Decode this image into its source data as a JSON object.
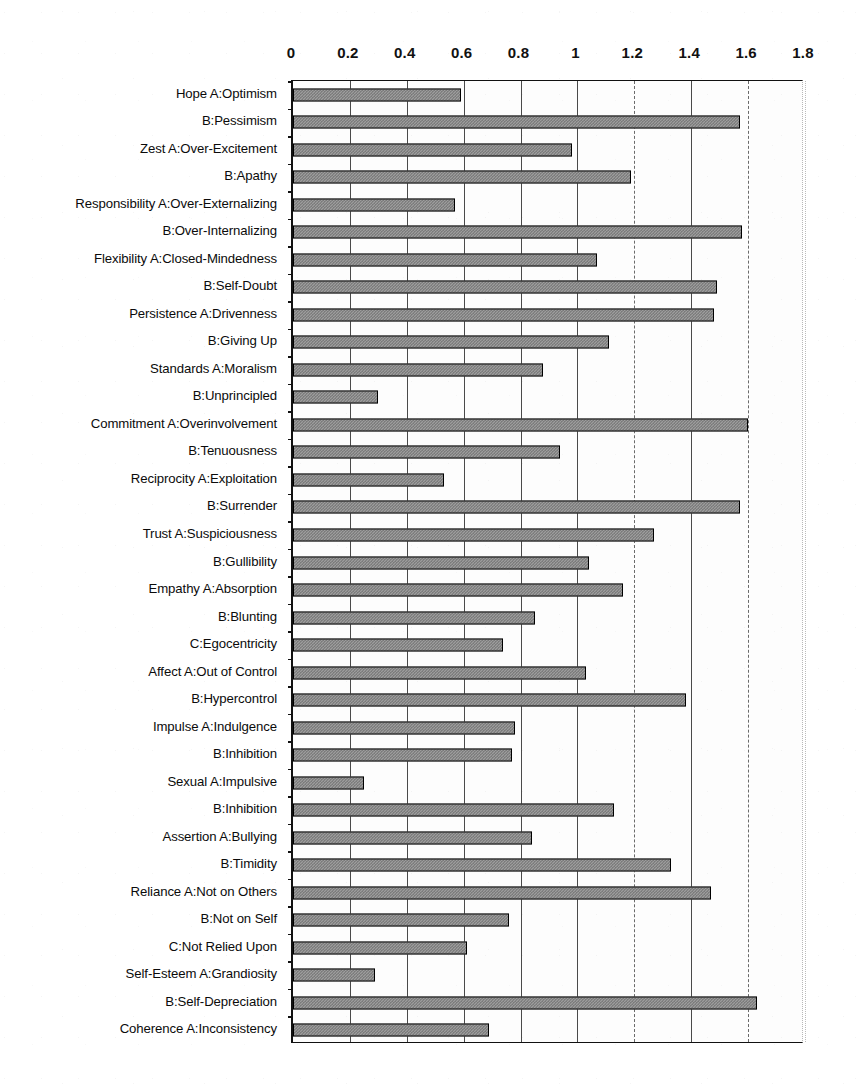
{
  "chart_data": {
    "type": "bar",
    "orientation": "horizontal",
    "title": "",
    "xlabel": "",
    "ylabel": "",
    "xlim": [
      0,
      1.8
    ],
    "xticks": [
      "0",
      "0.2",
      "0.4",
      "0.6",
      "0.8",
      "1",
      "1.2",
      "1.4",
      "1.6",
      "1.8"
    ],
    "xtick_values": [
      0,
      0.2,
      0.4,
      0.6,
      0.8,
      1.0,
      1.2,
      1.4,
      1.6,
      1.8
    ],
    "grid": true,
    "legend": "none",
    "axis_position": "top",
    "bar_fill": "#9d9d9d",
    "bar_pattern": "checkered-gray",
    "bar_border": "#000000",
    "categories": [
      "Hope A:Optimism",
      "B:Pessimism",
      "Zest A:Over-Excitement",
      "B:Apathy",
      "Responsibility A:Over-Externalizing",
      "B:Over-Internalizing",
      "Flexibility A:Closed-Mindedness",
      "B:Self-Doubt",
      "Persistence A:Drivenness",
      "B:Giving Up",
      "Standards A:Moralism",
      "B:Unprincipled",
      "Commitment A:Overinvolvement",
      "B:Tenuousness",
      "Reciprocity A:Exploitation",
      "B:Surrender",
      "Trust A:Suspiciousness",
      "B:Gullibility",
      "Empathy A:Absorption",
      "B:Blunting",
      "C:Egocentricity",
      "Affect A:Out of Control",
      "B:Hypercontrol",
      "Impulse A:Indulgence",
      "B:Inhibition",
      "Sexual A:Impulsive",
      "B:Inhibition",
      "Assertion A:Bullying",
      "B:Timidity",
      "Reliance A:Not on Others",
      "B:Not on Self",
      "C:Not Relied Upon",
      "Self-Esteem A:Grandiosity",
      "B:Self-Depreciation",
      "Coherence A:Inconsistency"
    ],
    "values": [
      0.59,
      1.57,
      0.98,
      1.19,
      0.57,
      1.58,
      1.07,
      1.49,
      1.48,
      1.11,
      0.88,
      0.3,
      1.6,
      0.94,
      0.53,
      1.57,
      1.27,
      1.04,
      1.16,
      0.85,
      0.74,
      1.03,
      1.38,
      0.78,
      0.77,
      0.25,
      1.13,
      0.84,
      1.33,
      1.47,
      0.76,
      0.61,
      0.29,
      1.63,
      0.69
    ]
  }
}
